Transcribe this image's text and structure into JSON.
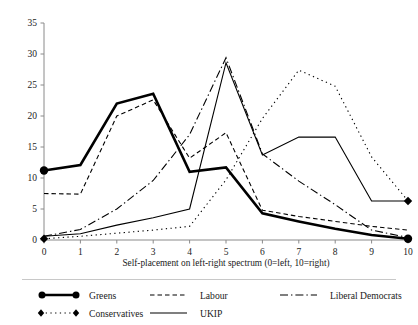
{
  "chart_data": {
    "type": "line",
    "title": "",
    "xlabel": "Self-placement on left-right spectrum (0=left, 10=right)",
    "ylabel": "",
    "x": [
      0,
      1,
      2,
      3,
      4,
      5,
      6,
      7,
      8,
      9,
      10
    ],
    "xlim": [
      0,
      10
    ],
    "ylim": [
      0,
      35
    ],
    "xticks": [
      "0",
      "1",
      "2",
      "3",
      "4",
      "5",
      "6",
      "7",
      "8",
      "9",
      "10"
    ],
    "yticks": [
      "0",
      "5",
      "10",
      "15",
      "20",
      "25",
      "30",
      "35"
    ],
    "grid": false,
    "legend_position": "below",
    "series": [
      {
        "name": "Greens",
        "style": "solid-thick-marker",
        "marker": "circle",
        "color": "#000000",
        "values": [
          11.2,
          12.1,
          22.0,
          23.6,
          11.0,
          11.7,
          4.3,
          3.0,
          1.8,
          0.8,
          0.2
        ]
      },
      {
        "name": "Labour",
        "style": "dashed",
        "marker": "none",
        "color": "#000000",
        "values": [
          7.5,
          7.4,
          20.0,
          22.6,
          13.2,
          17.3,
          4.8,
          3.8,
          3.0,
          2.2,
          1.6
        ]
      },
      {
        "name": "Liberal Democrats",
        "style": "dash-dot",
        "marker": "none",
        "color": "#000000",
        "values": [
          0.6,
          1.7,
          5.0,
          9.6,
          17.0,
          29.4,
          13.9,
          9.5,
          5.7,
          1.6,
          0.4
        ]
      },
      {
        "name": "Conservatives",
        "style": "dotted-marker",
        "marker": "diamond",
        "color": "#000000",
        "values": [
          0.2,
          0.6,
          1.1,
          1.6,
          2.2,
          9.7,
          19.6,
          27.4,
          24.8,
          13.4,
          6.3
        ]
      },
      {
        "name": "UKIP",
        "style": "solid-thin",
        "marker": "none",
        "color": "#000000",
        "values": [
          0.6,
          1.0,
          2.4,
          3.6,
          5.0,
          28.6,
          13.7,
          16.6,
          16.6,
          6.3,
          6.3
        ]
      }
    ]
  },
  "legend": {
    "entries": [
      {
        "label": "Greens",
        "swatch": "solid-thick-marker"
      },
      {
        "label": "Labour",
        "swatch": "dashed"
      },
      {
        "label": "Liberal Democrats",
        "swatch": "dash-dot"
      },
      {
        "label": "Conservatives",
        "swatch": "dotted-marker"
      },
      {
        "label": "UKIP",
        "swatch": "solid-thin"
      }
    ]
  },
  "colors": {
    "line": "#000000",
    "axis": "#8a8a8a",
    "text": "#1a1a1a",
    "background": "#ffffff"
  }
}
